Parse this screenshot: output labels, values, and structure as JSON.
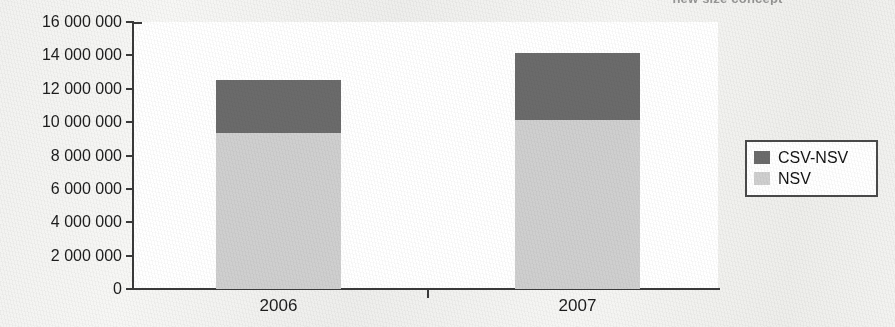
{
  "caption": {
    "text": "new size concept"
  },
  "chart_data": {
    "type": "bar",
    "subtype": "stacked-column",
    "title": "",
    "xlabel": "",
    "ylabel": "",
    "categories": [
      "2006",
      "2007"
    ],
    "series": [
      {
        "name": "NSV",
        "color": "#cfcfcf",
        "values": [
          9350000,
          10100000
        ]
      },
      {
        "name": "CSV-NSV",
        "color": "#6b6b6b",
        "values": [
          3150000,
          4050000
        ]
      }
    ],
    "totals": [
      12500000,
      14150000
    ],
    "ylim": [
      0,
      16000000
    ],
    "ytick_values": [
      0,
      2000000,
      4000000,
      6000000,
      8000000,
      10000000,
      12000000,
      14000000,
      16000000
    ],
    "ytick_labels": [
      "0",
      "2 000 000",
      "4 000 000",
      "6 000 000",
      "8 000 000",
      "10 000 000",
      "12 000 000",
      "14 000 000",
      "16 000 000"
    ],
    "grid": false,
    "legend_position": "right",
    "legend_entries": [
      {
        "label": "CSV-NSV",
        "color": "#6b6b6b"
      },
      {
        "label": "NSV",
        "color": "#cfcfcf"
      }
    ]
  },
  "colors": {
    "dark_series": "#6b6b6b",
    "light_series": "#cfcfcf",
    "axis": "#3a3a3a",
    "plot_background": "#ffffff",
    "page_background": "#f2f2f0"
  }
}
